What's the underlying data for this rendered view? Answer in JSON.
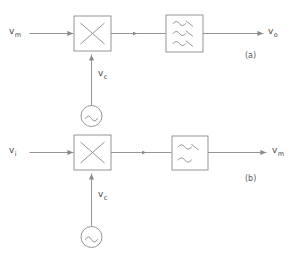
{
  "figure": {
    "background_color": "#ffffff",
    "line_color": "#8a8a8a",
    "text_color": "#4a4a4a",
    "width": 301,
    "height": 254
  },
  "panels": [
    {
      "tag": "(a)",
      "input_label": {
        "base": "v",
        "sub": "m"
      },
      "output_label": {
        "base": "v",
        "sub": "o"
      },
      "carrier_label": {
        "base": "v",
        "sub": "c"
      },
      "multiplier_symbol": "multiply-cross",
      "filter_symbol": "bandpass-three-waves",
      "filter_wave_count": 3,
      "oscillator_symbol": "sine-source"
    },
    {
      "tag": "(b)",
      "input_label": {
        "base": "v",
        "sub": "i"
      },
      "output_label": {
        "base": "v",
        "sub": "m"
      },
      "carrier_label": {
        "base": "v",
        "sub": "c"
      },
      "multiplier_symbol": "multiply-cross",
      "filter_symbol": "lowpass-two-waves",
      "filter_wave_count": 2,
      "oscillator_symbol": "sine-source"
    }
  ],
  "ghost_text": " "
}
